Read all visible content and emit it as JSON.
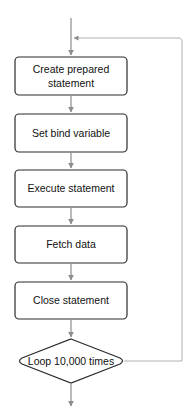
{
  "diagram": {
    "type": "flowchart",
    "colors": {
      "box_stroke": "#2b2b2b",
      "box_fill": "#ffffff",
      "arrow": "#8c8c8c",
      "loop_line": "#b0b0b0",
      "text": "#111111"
    },
    "steps": [
      {
        "id": "create",
        "lines": [
          "Create prepared",
          "statement"
        ]
      },
      {
        "id": "bind",
        "lines": [
          "Set bind variable"
        ]
      },
      {
        "id": "execute",
        "lines": [
          "Execute statement"
        ]
      },
      {
        "id": "fetch",
        "lines": [
          "Fetch data"
        ]
      },
      {
        "id": "close",
        "lines": [
          "Close statement"
        ]
      }
    ],
    "decision": {
      "id": "loop",
      "label": "Loop 10,000 times"
    },
    "edges": [
      {
        "from": "start",
        "to": "create"
      },
      {
        "from": "create",
        "to": "bind"
      },
      {
        "from": "bind",
        "to": "execute"
      },
      {
        "from": "execute",
        "to": "fetch"
      },
      {
        "from": "fetch",
        "to": "close"
      },
      {
        "from": "close",
        "to": "loop"
      },
      {
        "from": "loop",
        "to": "create",
        "kind": "loop-back"
      },
      {
        "from": "loop",
        "to": "end"
      }
    ]
  }
}
